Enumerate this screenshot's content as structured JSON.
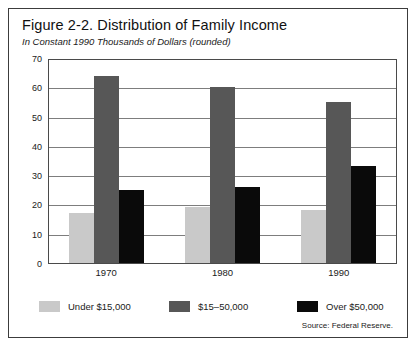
{
  "chart_data": {
    "type": "bar",
    "title": "Figure 2-2. Distribution of Family Income",
    "subtitle": "In Constant 1990 Thousands of Dollars (rounded)",
    "xlabel": "",
    "ylabel": "",
    "ylim": [
      0,
      70
    ],
    "yticks": [
      0,
      10,
      20,
      30,
      40,
      50,
      60,
      70
    ],
    "ytick_labels": [
      "0",
      "10",
      "20",
      "30",
      "40",
      "50",
      "60",
      "70"
    ],
    "grid": true,
    "legend_position": "bottom",
    "categories": [
      "1970",
      "1980",
      "1990"
    ],
    "series": [
      {
        "name": "Under $15,000",
        "color": "#c9c9c9",
        "values": [
          17,
          19,
          18
        ]
      },
      {
        "name": "$15–50,000",
        "color": "#575757",
        "values": [
          64,
          60,
          55
        ]
      },
      {
        "name": "Over $50,000",
        "color": "#0a0a0a",
        "values": [
          25,
          26,
          33
        ]
      }
    ],
    "source": "Source: Federal Reserve."
  }
}
